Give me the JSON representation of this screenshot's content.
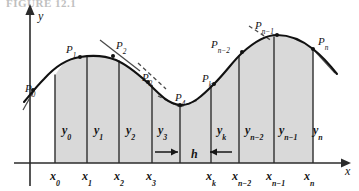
{
  "figure": {
    "kind": "math-diagram",
    "background_color": "#ffffff",
    "curve_color": "#111111",
    "fill_color": "#d9d9d9",
    "axis_color": "#2b2b2b",
    "ordinate_line_color": "#3a3a3a",
    "tangent_color": "#4a4a4a",
    "top_partial_text": "FIGURE 12.1"
  },
  "axes": {
    "y_axis_label": "y",
    "x_axis_label": "x"
  },
  "curve_points": [
    {
      "name": "P0",
      "base": "P",
      "sub": "0",
      "x": 33,
      "y": 90,
      "label_x": 25,
      "label_y": 83
    },
    {
      "name": "P1",
      "base": "P",
      "sub": "1",
      "x": 80,
      "y": 57,
      "label_x": 66,
      "label_y": 44
    },
    {
      "name": "P2",
      "base": "P",
      "sub": "2",
      "x": 113,
      "y": 56,
      "label_x": 116,
      "label_y": 40
    },
    {
      "name": "P3",
      "base": "P",
      "sub": "3",
      "x": 148,
      "y": 82,
      "label_x": 142,
      "label_y": 72
    },
    {
      "name": "P4",
      "base": "P",
      "sub": "4",
      "x": 180,
      "y": 105,
      "label_x": 175,
      "label_y": 92
    },
    {
      "name": "Pk",
      "base": "P",
      "sub": "k",
      "x": 214,
      "y": 84,
      "label_x": 202,
      "label_y": 73
    },
    {
      "name": "Pn-2",
      "base": "P",
      "sub": "n−2",
      "x": 242,
      "y": 52,
      "label_x": 211,
      "label_y": 39
    },
    {
      "name": "Pn-1",
      "base": "P",
      "sub": "n−1",
      "x": 277,
      "y": 35,
      "label_x": 255,
      "label_y": 20
    },
    {
      "name": "Pn",
      "base": "P",
      "sub": "n",
      "x": 313,
      "y": 49,
      "label_x": 318,
      "label_y": 36
    }
  ],
  "ordinates": [
    {
      "name": "y0",
      "base": "y",
      "sub": "0",
      "label_x": 62,
      "label_y": 124,
      "x_line": 55
    },
    {
      "name": "y1",
      "base": "y",
      "sub": "1",
      "label_x": 94,
      "label_y": 124,
      "x_line": 87
    },
    {
      "name": "y2",
      "base": "y",
      "sub": "2",
      "label_x": 126,
      "label_y": 124,
      "x_line": 119
    },
    {
      "name": "y3",
      "base": "y",
      "sub": "3",
      "label_x": 158,
      "label_y": 124,
      "x_line": 152
    },
    {
      "name": "yk",
      "base": "y",
      "sub": "k",
      "label_x": 217,
      "label_y": 124,
      "x_line": 211
    },
    {
      "name": "yn-2",
      "base": "y",
      "sub": "n−2",
      "label_x": 245,
      "label_y": 124,
      "x_line": 239
    },
    {
      "name": "yn-1",
      "base": "y",
      "sub": "n−1",
      "label_x": 279,
      "label_y": 124,
      "x_line": 274
    },
    {
      "name": "yn",
      "base": "y",
      "sub": "n",
      "label_x": 313,
      "label_y": 124,
      "x_line": 313
    }
  ],
  "abscissas": [
    {
      "name": "x0",
      "base": "x",
      "sub": "0",
      "label_x": 50,
      "label_y": 170,
      "tick_x": 55
    },
    {
      "name": "x1",
      "base": "x",
      "sub": "1",
      "label_x": 82,
      "label_y": 170,
      "tick_x": 87
    },
    {
      "name": "x2",
      "base": "x",
      "sub": "2",
      "label_x": 114,
      "label_y": 170,
      "tick_x": 119
    },
    {
      "name": "x3",
      "base": "x",
      "sub": "3",
      "label_x": 146,
      "label_y": 170,
      "tick_x": 152
    },
    {
      "name": "xk",
      "base": "x",
      "sub": "k",
      "label_x": 206,
      "label_y": 170,
      "tick_x": 211
    },
    {
      "name": "xn-2",
      "base": "x",
      "sub": "n−2",
      "label_x": 232,
      "label_y": 170,
      "tick_x": 239
    },
    {
      "name": "xn-1",
      "base": "x",
      "sub": "n−1",
      "label_x": 266,
      "label_y": 170,
      "tick_x": 274
    },
    {
      "name": "xn",
      "base": "x",
      "sub": "n",
      "label_x": 304,
      "label_y": 170,
      "tick_x": 313
    }
  ],
  "step": {
    "label": "h",
    "label_x": 191,
    "label_y": 148,
    "left_arrow_from_x": 155,
    "left_arrow_to_x": 178,
    "right_arrow_from_x": 232,
    "right_arrow_to_x": 210,
    "arrow_y": 152
  },
  "geometry": {
    "baseline_y": 163,
    "y_axis_x": 30,
    "y_axis_top_y": 13,
    "x_axis_right_x": 341,
    "region_left_x": 55,
    "region_right_x": 313,
    "curve_path": "M 24,102 C 30,95 36,87 44,79 C 53,69 66,59 80,57 C 92,55 106,56 116,60 C 128,65 139,75 148,83 C 158,93 168,104 180,105 C 192,106 203,95 214,84 C 226,72 234,60 242,53 C 254,42 266,35 277,35 C 290,35 303,41 313,49 C 322,56 330,65 337,74",
    "fill_path": "M 55,163 L 55,75.5 C 66,59 66,59 80,57 C 92,55 106,56 116,60 C 128,65 139,75 148,83 C 158,93 168,104 180,105 C 192,106 203,95 214,84 C 226,72 234,60 242,53 C 254,42 266,35 277,35 C 290,35 303,41 313,49 L 313,163 Z",
    "tangents": [
      {
        "name": "tangent-p2",
        "x1": 100,
        "y1": 40,
        "x2": 140,
        "y2": 71,
        "dashed": false
      },
      {
        "name": "tangent-p3",
        "x1": 138,
        "y1": 63,
        "x2": 166,
        "y2": 89,
        "dashed": true
      },
      {
        "name": "tangent-p0",
        "x1": 23,
        "y1": 110,
        "x2": 36,
        "y2": 87,
        "dashed": false
      },
      {
        "name": "tangent-p4-left",
        "x1": 158,
        "y1": 96,
        "x2": 180,
        "y2": 107,
        "dashed": true
      },
      {
        "name": "tangent-p4-right",
        "x1": 180,
        "y1": 107,
        "x2": 198,
        "y2": 100,
        "dashed": true
      },
      {
        "name": "tangent-pn1",
        "x1": 249,
        "y1": 26,
        "x2": 272,
        "y2": 41,
        "dashed": true
      },
      {
        "name": "tangent-pn",
        "x1": 313,
        "y1": 49,
        "x2": 335,
        "y2": 73,
        "dashed": false
      }
    ]
  }
}
